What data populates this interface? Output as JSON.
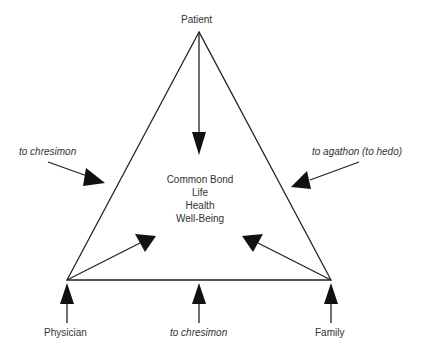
{
  "nodes": {
    "top": "Patient",
    "bottom_left": "Physician",
    "bottom_right": "Family"
  },
  "center": {
    "lines": [
      "Common Bond",
      "Life",
      "Health",
      "Well-Being"
    ]
  },
  "side_labels": {
    "left": "to chresimon",
    "right": "to agathon (to hedo)",
    "bottom": "to chresimon"
  },
  "colors": {
    "line": "#222222",
    "text": "#333333",
    "background": "#ffffff"
  }
}
